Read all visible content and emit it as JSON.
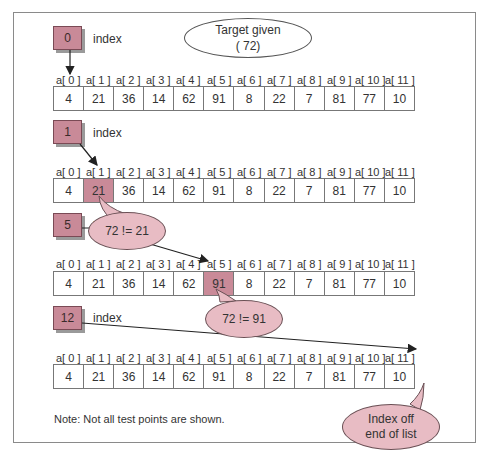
{
  "diagram": {
    "title_ellipse": {
      "line1": "Target given",
      "line2": "( 72)"
    },
    "array_labels": [
      "a[ 0 ]",
      "a[ 1 ]",
      "a[ 2 ]",
      "a[ 3 ]",
      "a[ 4 ]",
      "a[ 5 ]",
      "a[ 6 ]",
      "a[ 7 ]",
      "a[ 8 ]",
      "a[ 9 ]",
      "a[ 10 ]",
      "a[ 11 ]"
    ],
    "array_values": [
      "4",
      "21",
      "36",
      "14",
      "62",
      "91",
      "8",
      "22",
      "7",
      "81",
      "77",
      "10"
    ],
    "target": 72,
    "steps": [
      {
        "index_value": "0",
        "index_label": "index",
        "highlighted_cell": null,
        "bubble": null
      },
      {
        "index_value": "1",
        "index_label": "index",
        "highlighted_cell": 1,
        "bubble": "72 != 21"
      },
      {
        "index_value": "5",
        "index_label": "index",
        "highlighted_cell": 5,
        "bubble": "72 != 91"
      },
      {
        "index_value": "12",
        "index_label": "index",
        "highlighted_cell": null,
        "bubble_line1": "Index off",
        "bubble_line2": "end of list"
      }
    ],
    "note": "Note: Not all test points are shown.",
    "colors": {
      "highlight": "#c98a98",
      "bubble_fill": "#e8bcc4",
      "frame": "#8a8a8a"
    }
  }
}
